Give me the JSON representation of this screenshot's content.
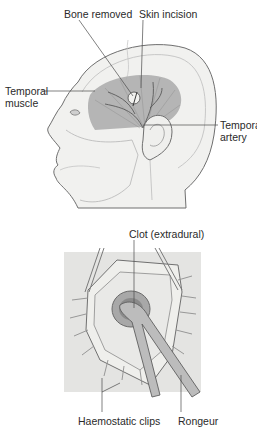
{
  "figure": {
    "top_panel": {
      "title": "Head lateral view with temporal region",
      "labels": {
        "bone_removed": "Bone removed",
        "skin_incision": "Skin incision",
        "temporal_muscle_1": "Temporal",
        "temporal_muscle_2": "muscle",
        "temporal_artery_1": "Temporal",
        "temporal_artery_2": "artery"
      }
    },
    "bottom_panel": {
      "title": "Burr hole with clot removal",
      "labels": {
        "clot": "Clot (extradural)",
        "haemostatic_clips": "Haemostatic clips",
        "rongeur": "Rongeur"
      }
    },
    "colors": {
      "skin": "#f0f0ee",
      "muscle": "#a9a9a9",
      "outline": "#6a6a6a",
      "panel_bg": "#e4e4e2",
      "label_text": "#2a2a2a"
    }
  }
}
